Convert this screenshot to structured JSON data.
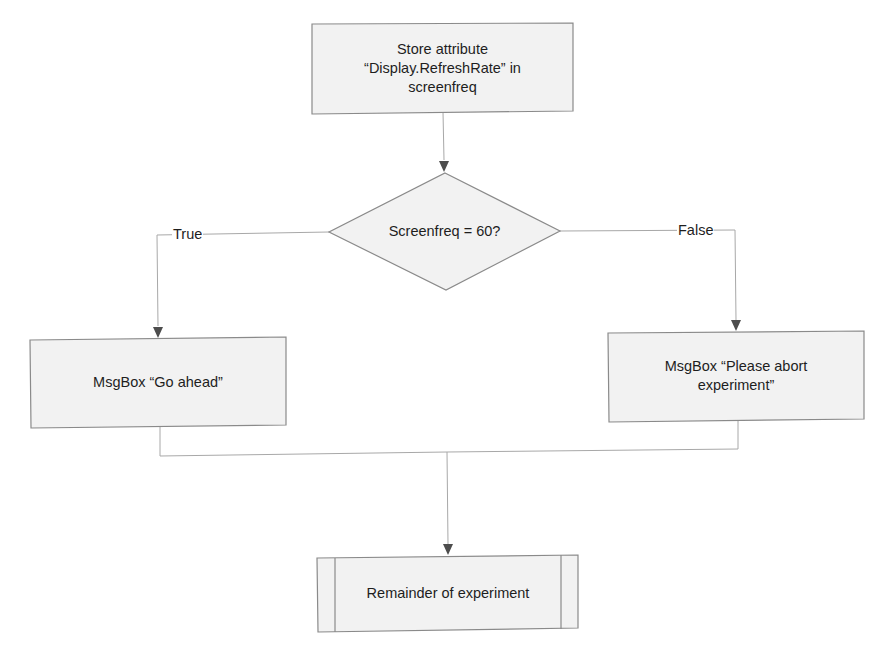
{
  "diagram": {
    "type": "flowchart",
    "colors": {
      "node_fill": "#f2f2f2",
      "node_stroke": "#8a8a8a",
      "edge_stroke": "#a8a8a8",
      "arrow_fill": "#4d4d4d",
      "text": "#1e1e1e"
    },
    "nodes": {
      "store": {
        "shape": "process",
        "label": "Store attribute\n“Display.RefreshRate” in\nscreenfreq"
      },
      "decision": {
        "shape": "decision",
        "label": "Screenfreq = 60?"
      },
      "go_ahead": {
        "shape": "process",
        "label": "MsgBox “Go ahead”"
      },
      "abort": {
        "shape": "process",
        "label": "MsgBox “Please abort\nexperiment”"
      },
      "remainder": {
        "shape": "predefined-process",
        "label": "Remainder of experiment"
      }
    },
    "edges": [
      {
        "from": "store",
        "to": "decision",
        "label": ""
      },
      {
        "from": "decision",
        "to": "go_ahead",
        "label": "True"
      },
      {
        "from": "decision",
        "to": "abort",
        "label": "False"
      },
      {
        "from": "go_ahead",
        "to": "remainder",
        "label": ""
      },
      {
        "from": "abort",
        "to": "remainder",
        "label": ""
      }
    ],
    "edge_labels": {
      "true": "True",
      "false": "False"
    }
  }
}
